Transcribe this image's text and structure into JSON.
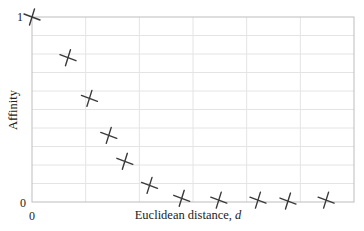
{
  "chart_data": {
    "type": "scatter",
    "title": "",
    "xlabel": "Euclidean distance, ",
    "xlabel_var": "d",
    "ylabel": "Affinity",
    "xlim": [
      0,
      6
    ],
    "ylim": [
      0,
      1
    ],
    "x_ticks": [
      {
        "value": 0,
        "label": "0"
      }
    ],
    "y_ticks": [
      {
        "value": 0,
        "label": "0"
      },
      {
        "value": 1,
        "label": "1"
      }
    ],
    "grid": {
      "on": true,
      "x_divisions": 6,
      "y_divisions": 10
    },
    "legend": null,
    "marker": "x-cross",
    "series": [
      {
        "name": "affinity",
        "x": [
          0.0,
          0.67,
          1.07,
          1.43,
          1.73,
          2.19,
          2.79,
          3.48,
          4.21,
          4.77,
          5.48
        ],
        "y": [
          1.0,
          0.78,
          0.56,
          0.36,
          0.22,
          0.09,
          0.02,
          0.01,
          0.01,
          0.005,
          0.01
        ]
      }
    ],
    "colors": {
      "marker": "#3a3a3a",
      "grid": "#e4e4e4",
      "frame": "#bdbdbd",
      "text": "#222222"
    }
  }
}
